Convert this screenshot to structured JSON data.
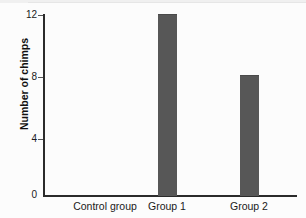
{
  "chart_data": {
    "type": "bar",
    "title": "",
    "xlabel": "",
    "ylabel": "Number of chimps",
    "categories": [
      "Control group",
      "Group 1",
      "Group 2"
    ],
    "values": [
      0,
      12,
      8
    ],
    "ylim": [
      0,
      12
    ],
    "yticks": [
      0,
      4,
      8,
      12
    ],
    "ytick_labels": [
      "0",
      "4",
      "8",
      "12"
    ],
    "grid": false,
    "legend": null,
    "bar_color": "#575757",
    "axis_color": "#2b2b2b",
    "background_color": "#fcfcfc"
  },
  "axes": {
    "y_title": "Number of chimps",
    "y_ticks": [
      {
        "label": "12",
        "value": 12
      },
      {
        "label": "8",
        "value": 8
      },
      {
        "label": "4",
        "value": 4
      },
      {
        "label": "0",
        "value": 0
      }
    ],
    "x_categories": [
      {
        "label": "Control group",
        "value": 0
      },
      {
        "label": "Group 1",
        "value": 12
      },
      {
        "label": "Group 2",
        "value": 8
      }
    ]
  }
}
